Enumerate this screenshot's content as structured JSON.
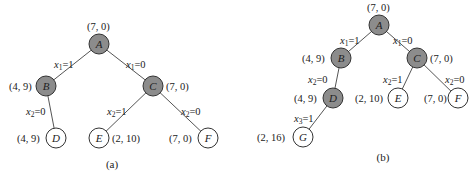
{
  "figures": [
    {
      "caption": "(a)",
      "nodes": [
        {
          "id": "A",
          "label": "A",
          "value": "(7, 0)",
          "shaded": true
        },
        {
          "id": "B",
          "label": "B",
          "value": "(4, 9)",
          "shaded": true
        },
        {
          "id": "C",
          "label": "C",
          "value": "(7, 0)",
          "shaded": true
        },
        {
          "id": "D",
          "label": "D",
          "value": "(4, 9)",
          "shaded": false
        },
        {
          "id": "E",
          "label": "E",
          "value": "(2, 10)",
          "shaded": false
        },
        {
          "id": "F",
          "label": "F",
          "value": "(7, 0)",
          "shaded": false
        }
      ],
      "edges": [
        {
          "from": "A",
          "to": "B",
          "var": "x",
          "sub": "1",
          "val": "=1"
        },
        {
          "from": "A",
          "to": "C",
          "var": "x",
          "sub": "1",
          "val": "=0"
        },
        {
          "from": "B",
          "to": "D",
          "var": "x",
          "sub": "2",
          "val": "=0"
        },
        {
          "from": "C",
          "to": "E",
          "var": "x",
          "sub": "2",
          "val": "=1"
        },
        {
          "from": "C",
          "to": "F",
          "var": "x",
          "sub": "2",
          "val": "=0"
        }
      ]
    },
    {
      "caption": "(b)",
      "nodes": [
        {
          "id": "A",
          "label": "A",
          "value": "(7, 0)",
          "shaded": true
        },
        {
          "id": "B",
          "label": "B",
          "value": "(4, 9)",
          "shaded": true
        },
        {
          "id": "C",
          "label": "C",
          "value": "(7, 0)",
          "shaded": true
        },
        {
          "id": "D",
          "label": "D",
          "value": "(4, 9)",
          "shaded": true
        },
        {
          "id": "E",
          "label": "E",
          "value": "(2, 10)",
          "shaded": false
        },
        {
          "id": "F",
          "label": "F",
          "value": "(7, 0)",
          "shaded": false
        },
        {
          "id": "G",
          "label": "G",
          "value": "(2, 16)",
          "shaded": false
        }
      ],
      "edges": [
        {
          "from": "A",
          "to": "B",
          "var": "x",
          "sub": "1",
          "val": "=1"
        },
        {
          "from": "A",
          "to": "C",
          "var": "x",
          "sub": "1",
          "val": "=0"
        },
        {
          "from": "B",
          "to": "D",
          "var": "x",
          "sub": "2",
          "val": "=0"
        },
        {
          "from": "C",
          "to": "E",
          "var": "x",
          "sub": "2",
          "val": "=1"
        },
        {
          "from": "C",
          "to": "F",
          "var": "x",
          "sub": "2",
          "val": "=0"
        },
        {
          "from": "D",
          "to": "G",
          "var": "x",
          "sub": "3",
          "val": "=1"
        }
      ]
    }
  ]
}
